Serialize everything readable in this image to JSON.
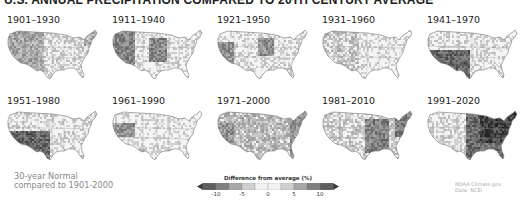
{
  "title": "U.S. ANNUAL PRECIPITATION COMPARED TO 20TH CENTURY AVERAGE",
  "panels": [
    {
      "label": "1901–1930",
      "pattern": "west-patchy"
    },
    {
      "label": "1911–1940",
      "pattern": "west-plains-dark"
    },
    {
      "label": "1921–1950",
      "pattern": "plains-dark"
    },
    {
      "label": "1931–1960",
      "pattern": "west-light"
    },
    {
      "label": "1941–1970",
      "pattern": "southwest-dark"
    },
    {
      "label": "1951–1980",
      "pattern": "southwest-dark"
    },
    {
      "label": "1961–1990",
      "pattern": "scattered-light"
    },
    {
      "label": "1971–2000",
      "pattern": "mixed"
    },
    {
      "label": "1981–2010",
      "pattern": "central-east-dark"
    },
    {
      "label": "1991–2020",
      "pattern": "east-very-dark"
    }
  ],
  "footnote": {
    "line1": "30-year Normal",
    "line2": "compared to 1901-2000"
  },
  "legend": {
    "title": "Difference from average (%)",
    "ticks": [
      "-10",
      "-5",
      "0",
      "5",
      "10"
    ],
    "bins": [
      "#3a3a3a",
      "#5e5e5e",
      "#7f7f7f",
      "#a6a6a6",
      "#d0d0d0",
      "#f2f2f2",
      "#f2f2f2",
      "#d0d0d0",
      "#a6a6a6",
      "#7f7f7f",
      "#5e5e5e",
      "#3a3a3a"
    ]
  },
  "credit": {
    "line1": "NOAA Climate.gov",
    "line2": "Data: NCEI"
  },
  "chart_data": {
    "type": "heatmap",
    "title": "U.S. Annual Precipitation Compared to 20th Century Average",
    "subtitle": "30-year Normal compared to 1901-2000",
    "categories": [
      "1901–1930",
      "1911–1940",
      "1921–1950",
      "1931–1960",
      "1941–1970",
      "1951–1980",
      "1961–1990",
      "1971–2000",
      "1981–2010",
      "1991–2020"
    ],
    "legend": {
      "label": "Difference from average (%)",
      "ticks": [
        -10,
        -5,
        0,
        5,
        10
      ],
      "range": [
        -10,
        10
      ]
    },
    "layout": {
      "rows": 2,
      "cols": 5
    }
  }
}
